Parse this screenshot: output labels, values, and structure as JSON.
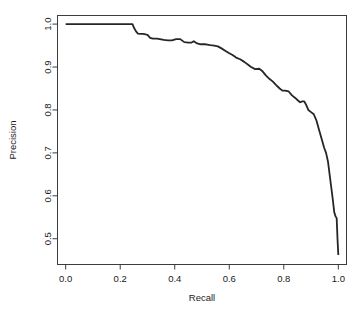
{
  "chart_data": {
    "type": "line",
    "title": "",
    "xlabel": "Recall",
    "ylabel": "Precision",
    "xlim": [
      -0.03,
      1.03
    ],
    "ylim": [
      0.44,
      1.02
    ],
    "grid": false,
    "legend": null,
    "line_color": "#262626",
    "line_width": 1.8,
    "xticks": [
      0.0,
      0.2,
      0.4,
      0.6,
      0.8,
      1.0
    ],
    "xtick_labels": [
      "0.0",
      "0.2",
      "0.4",
      "0.6",
      "0.8",
      "1.0"
    ],
    "yticks": [
      0.5,
      0.6,
      0.7,
      0.8,
      0.9,
      1.0
    ],
    "ytick_labels": [
      "0.5",
      "0.6",
      "0.7",
      "0.8",
      "0.9",
      "1.0"
    ],
    "series": [
      {
        "name": "precision-recall",
        "x": [
          0.0,
          0.04,
          0.08,
          0.12,
          0.16,
          0.2,
          0.24,
          0.245,
          0.25,
          0.258,
          0.265,
          0.275,
          0.285,
          0.3,
          0.31,
          0.32,
          0.335,
          0.345,
          0.36,
          0.375,
          0.39,
          0.405,
          0.42,
          0.435,
          0.45,
          0.462,
          0.47,
          0.482,
          0.495,
          0.51,
          0.52,
          0.53,
          0.545,
          0.558,
          0.57,
          0.585,
          0.6,
          0.612,
          0.625,
          0.64,
          0.655,
          0.668,
          0.68,
          0.695,
          0.71,
          0.722,
          0.735,
          0.748,
          0.76,
          0.772,
          0.785,
          0.795,
          0.805,
          0.818,
          0.83,
          0.842,
          0.852,
          0.86,
          0.868,
          0.875,
          0.882,
          0.89,
          0.9,
          0.91,
          0.92,
          0.93,
          0.94,
          0.948,
          0.955,
          0.962,
          0.968,
          0.974,
          0.98,
          0.985,
          0.99,
          0.994,
          0.997,
          1.0
        ],
        "y": [
          1.0,
          1.0,
          1.0,
          1.0,
          1.0,
          1.0,
          1.0,
          1.0,
          0.992,
          0.983,
          0.978,
          0.977,
          0.977,
          0.975,
          0.968,
          0.966,
          0.966,
          0.965,
          0.963,
          0.962,
          0.962,
          0.965,
          0.965,
          0.958,
          0.957,
          0.957,
          0.96,
          0.955,
          0.953,
          0.953,
          0.952,
          0.951,
          0.95,
          0.948,
          0.944,
          0.938,
          0.932,
          0.928,
          0.922,
          0.918,
          0.912,
          0.906,
          0.9,
          0.895,
          0.896,
          0.89,
          0.88,
          0.872,
          0.866,
          0.858,
          0.85,
          0.845,
          0.845,
          0.843,
          0.834,
          0.828,
          0.822,
          0.818,
          0.82,
          0.82,
          0.812,
          0.8,
          0.795,
          0.79,
          0.775,
          0.752,
          0.73,
          0.712,
          0.7,
          0.68,
          0.65,
          0.62,
          0.59,
          0.562,
          0.552,
          0.548,
          0.5,
          0.462
        ]
      }
    ]
  }
}
